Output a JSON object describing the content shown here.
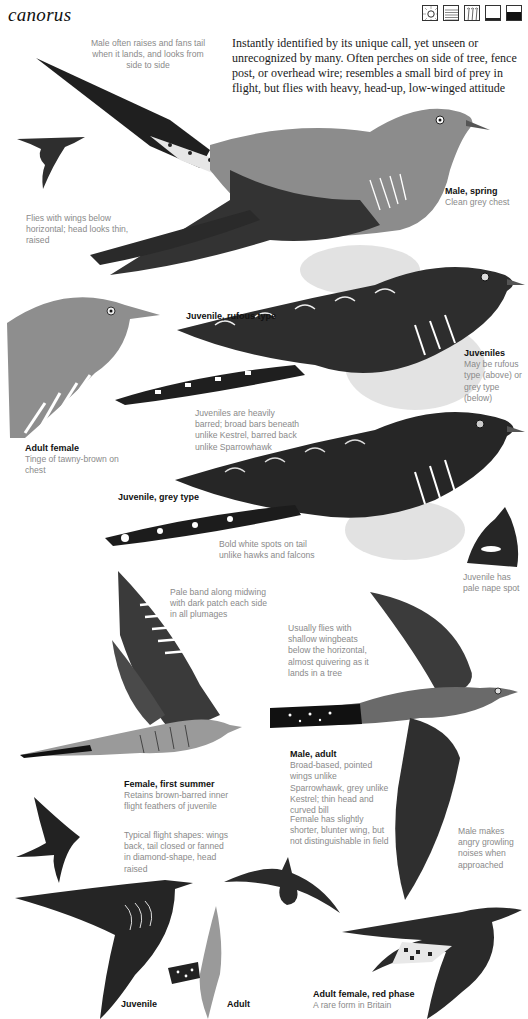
{
  "page": {
    "species_name": "canorus",
    "habitat_icons": [
      {
        "name": "sun-icon",
        "meaning": "open/sunny habitat"
      },
      {
        "name": "water-lines-icon",
        "meaning": "wetland"
      },
      {
        "name": "reeds-icon",
        "meaning": "reedbed"
      },
      {
        "name": "ground-low-icon",
        "meaning": "lowland"
      },
      {
        "name": "ground-dark-icon",
        "meaning": "dense cover"
      }
    ],
    "intro": "Instantly identified by its unique call, yet unseen or unrecognized by many. Often perches on side of tree, fence post, or overhead wire; resembles a small bird of prey in flight, but flies with heavy, head-up, low-winged attitude"
  },
  "annotations": {
    "tail_fan": "Male often raises and fans tail when it lands, and looks from side to side",
    "flight_wings_below": "Flies with wings below horizontal; head looks thin, raised",
    "male_spring": {
      "title": "Male, spring",
      "text": "Clean grey chest"
    },
    "juvenile_rufous": {
      "title": "Juvenile, rufous type"
    },
    "adult_female": {
      "title": "Adult female",
      "text": "Tinge of tawny-brown on chest"
    },
    "juveniles": {
      "title": "Juveniles",
      "text": "May be rufous type (above) or grey type (below)"
    },
    "juveniles_barred": "Juveniles are heavily barred; broad bars beneath unlike Kestrel, barred back unlike Sparrowhawk",
    "juvenile_grey": {
      "title": "Juvenile, grey type"
    },
    "white_spots_tail": "Bold white spots on tail unlike hawks and falcons",
    "nape_spot": "Juvenile has pale nape spot",
    "pale_band": "Pale band along midwing with dark patch each side in all plumages",
    "usually_flies": "Usually flies with shallow wingbeats below the horizontal, almost quivering as it lands in a tree",
    "male_adult": {
      "title": "Male, adult",
      "text": "Broad-based, pointed wings unlike Sparrowhawk, grey unlike Kestrel; thin head and curved bill"
    },
    "female_shorter": "Female has slightly shorter, blunter wing, but not distinguishable in field",
    "female_first_summer": {
      "title": "Female, first summer",
      "text": "Retains brown-barred inner flight feathers of juvenile"
    },
    "typical_flight": "Typical flight shapes: wings back, tail closed or fanned in diamond-shape, head raised",
    "growling": "Male makes angry growling noises when approached",
    "juvenile_flight": {
      "title": "Juvenile"
    },
    "adult_flight": {
      "title": "Adult"
    },
    "red_phase": {
      "title": "Adult female, red phase",
      "text": "A rare form in Britain"
    }
  },
  "colors": {
    "adult_grey": "#8c8c8c",
    "dark_plumage": "#2b2b2b",
    "barring_dark": "#1e1e1e",
    "note_text": "#8a8a8a",
    "foliage": "#c9c9c9"
  }
}
